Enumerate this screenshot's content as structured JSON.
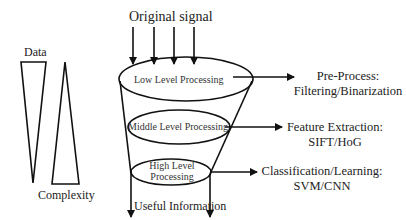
{
  "diagram": {
    "input_label": "Original signal",
    "output_label": "Useful Information",
    "stages": [
      {
        "label": "Low Level Processing",
        "output": {
          "line1": "Pre-Process:",
          "line2": "Filtering/Binarization"
        }
      },
      {
        "label": "Middle Level Processing",
        "output": {
          "line1": "Feature Extraction:",
          "line2": "SIFT/HoG"
        }
      },
      {
        "label_line1": "High Level",
        "label_line2": "Processing",
        "output": {
          "line1": "Classification/Learning:",
          "line2": "SVM/CNN"
        }
      }
    ],
    "triangles": {
      "data_label": "Data",
      "complexity_label": "Complexity"
    },
    "colors": {
      "stroke": "#111111",
      "background": "#ffffff",
      "text": "#222222"
    }
  }
}
